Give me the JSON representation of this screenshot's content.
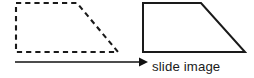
{
  "figure": {
    "name": "slide-to-image-projection-diagram",
    "background_color": "#ffffff",
    "stroke_color": "#1a1a1a",
    "width": 254,
    "height": 78,
    "caption": "slide image",
    "caption_color": "#1a1a1a",
    "shapes": {
      "slide": {
        "label_role": "source-object",
        "style": "dashed",
        "dash_pattern": "5.2 4.0",
        "stroke_width": 2.1,
        "points": "16,3 77,3 118,52 16,52"
      },
      "image": {
        "label_role": "projected-image",
        "style": "solid",
        "stroke_width": 2.0,
        "points": "143,3 201,3 245,52 143,52"
      }
    },
    "arrow": {
      "name": "projection-arrow",
      "direction": "right",
      "shaft_from_x": 15,
      "shaft_to_x": 139,
      "shaft_y": 62,
      "head_points": "139,57.5 148,62 139,66.5",
      "stroke_width": 1.5,
      "color": "#111111"
    },
    "caption_position": {
      "x": 152,
      "y": 71
    }
  }
}
